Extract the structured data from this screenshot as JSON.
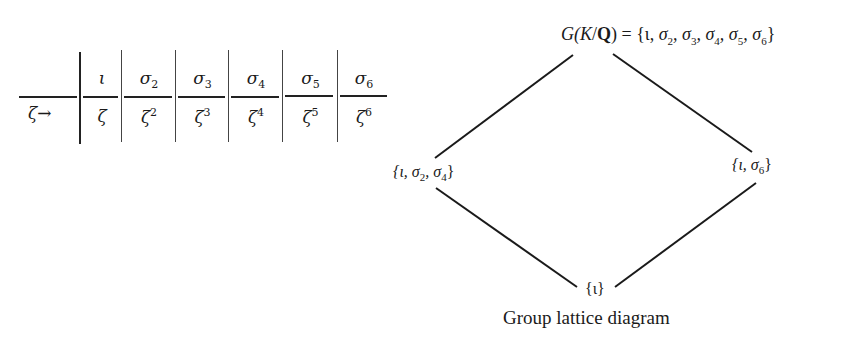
{
  "table": {
    "row_label": "ζ→",
    "header_symbol": "σ",
    "columns": [
      {
        "header_base": "ι",
        "header_sub": "",
        "value_base": "ζ",
        "value_sup": ""
      },
      {
        "header_base": "σ",
        "header_sub": "2",
        "value_base": "ζ",
        "value_sup": "2"
      },
      {
        "header_base": "σ",
        "header_sub": "3",
        "value_base": "ζ",
        "value_sup": "3"
      },
      {
        "header_base": "σ",
        "header_sub": "4",
        "value_base": "ζ",
        "value_sup": "4"
      },
      {
        "header_base": "σ",
        "header_sub": "5",
        "value_base": "ζ",
        "value_sup": "5"
      },
      {
        "header_base": "σ",
        "header_sub": "6",
        "value_base": "ζ",
        "value_sup": "6"
      }
    ]
  },
  "lattice": {
    "top": {
      "prefix_G": "G(",
      "prefix_K": "K",
      "slash": "/",
      "field_Q": "Q",
      "suffix": ") = {ι, ",
      "elements": [
        "σ",
        "2",
        ", σ",
        "3",
        ", σ",
        "4",
        ", σ",
        "5",
        ", σ",
        "6"
      ],
      "close": "}",
      "full_text": "G(K/Q) = {ι, σ2, σ3, σ4, σ5, σ6}"
    },
    "left": {
      "full_text": "{ι, σ2, σ4}",
      "open": "{ι, σ",
      "s1": "2",
      "mid": ", σ",
      "s2": "4",
      "close": "}"
    },
    "right": {
      "full_text": "{ι, σ6}",
      "open": "{ι, σ",
      "s1": "6",
      "close": "}"
    },
    "bottom": {
      "full_text": "{ι}"
    },
    "edges": [
      {
        "from": "top",
        "to": "left"
      },
      {
        "from": "top",
        "to": "right"
      },
      {
        "from": "left",
        "to": "bottom"
      },
      {
        "from": "right",
        "to": "bottom"
      }
    ],
    "caption": "Group lattice diagram"
  }
}
